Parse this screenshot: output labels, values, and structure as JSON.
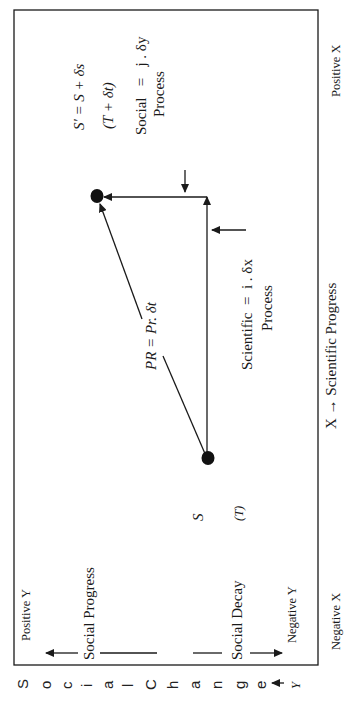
{
  "diagram": {
    "orientation": "rotated -90deg (text reads bottom-to-top)",
    "x_axis": {
      "label": "X → Scientific Progress",
      "positive_label": "Positive X",
      "negative_label": "Negative X"
    },
    "y_axis": {
      "side_label_letters": [
        "S",
        "o",
        "c",
        "i",
        "a",
        "l",
        "C",
        "h",
        "a",
        "n",
        "g",
        "e"
      ],
      "side_label_arrow": "↑",
      "side_label_var": "Y",
      "positive_label": "Positive Y",
      "negative_label": "Negative Y",
      "upper_label": "Social Progress",
      "lower_label": "Social Decay"
    },
    "points": {
      "start": {
        "name": "S",
        "time": "(T)"
      },
      "end": {
        "formula": "S' = S + δs",
        "time": "(T + δt)"
      }
    },
    "processes": {
      "scientific": {
        "formula": "Scientific  =  i . δx",
        "caption": "Process"
      },
      "social": {
        "formula": "Social   =   j . δy",
        "caption": "Process"
      },
      "progress": {
        "formula": "PR = Pr. δt"
      }
    },
    "colors": {
      "ink": "#1a1a1a",
      "background": "#ffffff"
    }
  }
}
